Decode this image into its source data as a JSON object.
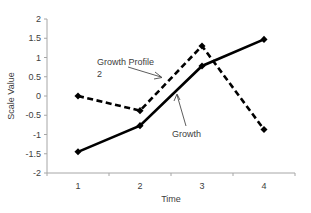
{
  "chart_data": {
    "type": "line",
    "title": "",
    "xlabel": "Time",
    "ylabel": "Scale Value",
    "categories": [
      "1",
      "2",
      "3",
      "4"
    ],
    "x": [
      1,
      2,
      3,
      4
    ],
    "ylim": [
      -2,
      2
    ],
    "yticks": [
      2,
      1.5,
      1,
      0.5,
      0,
      -0.5,
      -1,
      -1.5,
      -2
    ],
    "ytick_labels": [
      "2",
      "1.5",
      "1",
      "0.5",
      "0",
      "-0.5",
      "-1",
      "-1.5",
      "-2"
    ],
    "grid": false,
    "legend": "none (inline annotations with arrows)",
    "series": [
      {
        "name": "Growth",
        "style": "solid",
        "color": "#000000",
        "values": [
          -1.45,
          -0.77,
          0.78,
          1.47
        ]
      },
      {
        "name": "Growth Profile 2",
        "style": "dashed",
        "color": "#000000",
        "values": [
          0.0,
          -0.38,
          1.3,
          -0.87
        ]
      }
    ],
    "annotations": [
      {
        "text_lines": [
          "Growth Profile",
          "2"
        ],
        "target_series": "Growth Profile 2"
      },
      {
        "text_lines": [
          "Growth"
        ],
        "target_series": "Growth"
      }
    ]
  }
}
